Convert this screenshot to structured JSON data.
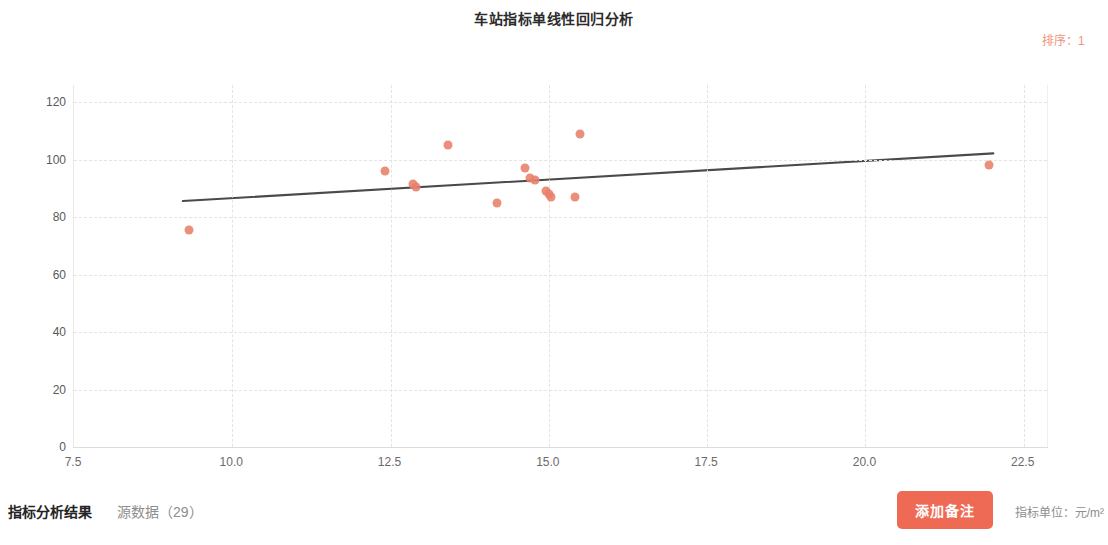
{
  "header": {
    "title": "车站指标单线性回归分析",
    "sort_label": "排序：1"
  },
  "footer": {
    "result_title": "指标分析结果",
    "source_data": "源数据（29）",
    "add_note_label": "添加备注",
    "unit_label": "指标单位：元/m²"
  },
  "chart_data": {
    "type": "scatter",
    "title": "车站指标单线性回归分析",
    "xlabel": "",
    "ylabel": "",
    "xlim": [
      7.5,
      22.9
    ],
    "ylim": [
      0,
      126
    ],
    "xticks": [
      "7.5",
      "10.0",
      "12.5",
      "15.0",
      "17.5",
      "20.0",
      "22.5"
    ],
    "xtick_values": [
      7.5,
      10.0,
      12.5,
      15.0,
      17.5,
      20.0,
      22.5
    ],
    "yticks": [
      "0",
      "20",
      "40",
      "60",
      "80",
      "100",
      "120"
    ],
    "ytick_values": [
      0,
      20,
      40,
      60,
      80,
      100,
      120
    ],
    "grid": true,
    "legend": "none",
    "point_color": "#e8806b",
    "line_color": "#4a4a4a",
    "points": [
      {
        "x": 9.32,
        "y": 75.5
      },
      {
        "x": 12.42,
        "y": 96.0
      },
      {
        "x": 12.86,
        "y": 91.5
      },
      {
        "x": 12.9,
        "y": 90.5
      },
      {
        "x": 13.4,
        "y": 105.0
      },
      {
        "x": 14.18,
        "y": 85.0
      },
      {
        "x": 14.62,
        "y": 97.0
      },
      {
        "x": 14.7,
        "y": 93.5
      },
      {
        "x": 14.78,
        "y": 93.0
      },
      {
        "x": 14.96,
        "y": 89.0
      },
      {
        "x": 15.0,
        "y": 88.0
      },
      {
        "x": 15.04,
        "y": 87.0
      },
      {
        "x": 15.42,
        "y": 87.0
      },
      {
        "x": 15.5,
        "y": 109.0
      },
      {
        "x": 21.96,
        "y": 98.0
      }
    ],
    "regression_line": {
      "x_start": 9.22,
      "y_start": 85.6,
      "x_end": 22.02,
      "y_end": 102.2
    }
  }
}
